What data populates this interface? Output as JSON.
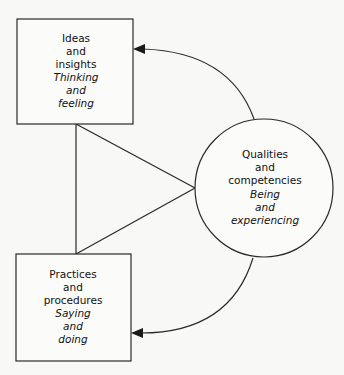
{
  "diagram": {
    "type": "conceptual-triad",
    "nodes": {
      "ideas": {
        "shape": "rectangle",
        "lines": [
          {
            "text": "Ideas",
            "italic": false
          },
          {
            "text": "and",
            "italic": false
          },
          {
            "text": "insights",
            "italic": false
          },
          {
            "text": "Thinking",
            "italic": true
          },
          {
            "text": "and",
            "italic": true
          },
          {
            "text": "feeling",
            "italic": true
          }
        ]
      },
      "practices": {
        "shape": "rectangle",
        "lines": [
          {
            "text": "Practices",
            "italic": false
          },
          {
            "text": "and",
            "italic": false
          },
          {
            "text": "procedures",
            "italic": false
          },
          {
            "text": "Saying",
            "italic": true
          },
          {
            "text": "and",
            "italic": true
          },
          {
            "text": "doing",
            "italic": true
          }
        ]
      },
      "qualities": {
        "shape": "circle",
        "lines": [
          {
            "text": "Qualities",
            "italic": false
          },
          {
            "text": "and",
            "italic": false
          },
          {
            "text": "competencies",
            "italic": false
          },
          {
            "text": "Being",
            "italic": true
          },
          {
            "text": "and",
            "italic": true
          },
          {
            "text": "experiencing",
            "italic": true
          }
        ]
      }
    },
    "connectors": [
      {
        "from": "qualities",
        "to": "ideas",
        "kind": "curved-arrow"
      },
      {
        "from": "qualities",
        "to": "practices",
        "kind": "curved-arrow"
      },
      {
        "from": "ideas",
        "to": "practices",
        "kind": "triangle-link",
        "via": "qualities"
      }
    ],
    "colors": {
      "stroke": "#2a2a2a",
      "text": "#111111",
      "background": "#f8f8f6"
    }
  }
}
